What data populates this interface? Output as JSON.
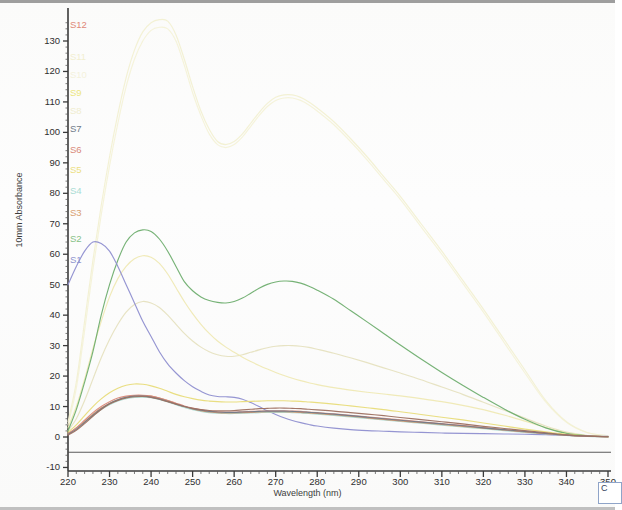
{
  "chart_data": {
    "type": "line",
    "title": "",
    "xlabel": "Wavelength (nm)",
    "ylabel": "10mm Absorbance",
    "xlim": [
      220,
      350
    ],
    "ylim": [
      -10,
      137
    ],
    "xticks": [
      220,
      230,
      240,
      250,
      260,
      270,
      280,
      290,
      300,
      310,
      320,
      330,
      340,
      350
    ],
    "yticks": [
      -10,
      0,
      10,
      20,
      30,
      40,
      50,
      60,
      70,
      80,
      90,
      100,
      110,
      120,
      130
    ],
    "grid": false,
    "legend_position": "left-axis-stack",
    "x": [
      220,
      222,
      224,
      226,
      228,
      230,
      232,
      234,
      236,
      238,
      240,
      242,
      244,
      246,
      248,
      250,
      252,
      254,
      256,
      258,
      260,
      262,
      264,
      266,
      268,
      270,
      272,
      274,
      276,
      278,
      280,
      284,
      288,
      292,
      296,
      300,
      305,
      310,
      315,
      320,
      325,
      330,
      335,
      340,
      345,
      350
    ],
    "series": [
      {
        "name": "S1",
        "color": "#8f8fd0",
        "values": [
          50,
          56,
          61,
          64,
          63.5,
          61,
          56,
          50,
          44,
          38,
          33,
          28,
          24,
          21,
          18.5,
          16.5,
          15,
          13.8,
          13.3,
          13.2,
          13.0,
          12.4,
          11.3,
          10.0,
          8.6,
          7.4,
          6.3,
          5.4,
          4.7,
          4.1,
          3.6,
          2.9,
          2.4,
          2.1,
          1.9,
          1.7,
          1.5,
          1.3,
          1.2,
          1.1,
          1.0,
          0.9,
          0.8,
          0.5,
          0.3,
          0.2
        ]
      },
      {
        "name": "S2",
        "color": "#6fae6f",
        "values": [
          2,
          9,
          18,
          28,
          40,
          50,
          58,
          64,
          67,
          68,
          67.5,
          65,
          61,
          56,
          51,
          48,
          46,
          44.8,
          44.2,
          44.0,
          44.5,
          45.6,
          47.2,
          48.8,
          50.1,
          50.9,
          51.2,
          51.1,
          50.5,
          49.5,
          48.2,
          45.2,
          41.5,
          37.8,
          34.0,
          30.2,
          25.6,
          21.2,
          17.0,
          13.0,
          9.2,
          5.8,
          3.0,
          1.2,
          0.4,
          0.1
        ]
      },
      {
        "name": "S3",
        "color": "#d2956a",
        "values": [
          1,
          3,
          5,
          7.5,
          9.5,
          11,
          12.2,
          13.0,
          13.5,
          13.6,
          13.4,
          12.8,
          12.0,
          11.0,
          10.0,
          9.2,
          8.6,
          8.2,
          8.0,
          7.9,
          7.9,
          8.0,
          8.1,
          8.2,
          8.3,
          8.3,
          8.3,
          8.2,
          8.1,
          7.9,
          7.7,
          7.3,
          6.8,
          6.3,
          5.8,
          5.3,
          4.7,
          4.1,
          3.5,
          2.9,
          2.3,
          1.7,
          1.1,
          0.6,
          0.3,
          0.1
        ]
      },
      {
        "name": "S4",
        "color": "#a8d8d0",
        "values": [
          1,
          2.8,
          4.8,
          7,
          9,
          10.6,
          11.8,
          12.6,
          13.0,
          13.1,
          12.9,
          12.3,
          11.5,
          10.6,
          9.7,
          9.0,
          8.4,
          8.0,
          7.8,
          7.7,
          7.7,
          7.8,
          7.9,
          8.0,
          8.1,
          8.1,
          8.1,
          8.0,
          7.9,
          7.7,
          7.5,
          7.1,
          6.6,
          6.1,
          5.6,
          5.1,
          4.5,
          3.9,
          3.3,
          2.7,
          2.1,
          1.5,
          1.0,
          0.5,
          0.2,
          0.1
        ]
      },
      {
        "name": "S5",
        "color": "#e8dc7a",
        "values": [
          1.5,
          4,
          7,
          10,
          12.5,
          14.5,
          16,
          17,
          17.4,
          17.3,
          16.8,
          16.0,
          15.0,
          14.0,
          13.2,
          12.6,
          12.1,
          11.8,
          11.6,
          11.5,
          11.5,
          11.6,
          11.7,
          11.8,
          11.9,
          11.9,
          11.9,
          11.8,
          11.7,
          11.5,
          11.3,
          10.8,
          10.2,
          9.6,
          9.0,
          8.3,
          7.4,
          6.5,
          5.6,
          4.6,
          3.6,
          2.6,
          1.7,
          0.9,
          0.4,
          0.1
        ]
      },
      {
        "name": "S6",
        "color": "#d98a7a",
        "values": [
          1,
          3,
          5.5,
          8,
          10,
          11.6,
          12.8,
          13.4,
          13.7,
          13.7,
          13.4,
          12.8,
          12.0,
          11.1,
          10.2,
          9.5,
          8.9,
          8.5,
          8.3,
          8.2,
          8.2,
          8.3,
          8.4,
          8.5,
          8.6,
          8.6,
          8.6,
          8.5,
          8.4,
          8.2,
          8.0,
          7.6,
          7.1,
          6.6,
          6.1,
          5.6,
          5.0,
          4.4,
          3.8,
          3.1,
          2.4,
          1.8,
          1.2,
          0.6,
          0.3,
          0.1
        ]
      },
      {
        "name": "S7",
        "color": "#6f7a88",
        "values": [
          0.8,
          2.5,
          4.8,
          7.2,
          9.3,
          11.0,
          12.2,
          13.0,
          13.4,
          13.4,
          13.1,
          12.5,
          11.7,
          10.8,
          10.0,
          9.3,
          8.8,
          8.4,
          8.2,
          8.1,
          8.1,
          8.2,
          8.3,
          8.4,
          8.5,
          8.5,
          8.5,
          8.4,
          8.3,
          8.1,
          7.9,
          7.5,
          7.0,
          6.5,
          6.0,
          5.5,
          4.9,
          4.3,
          3.7,
          3.0,
          2.4,
          1.8,
          1.2,
          0.6,
          0.3,
          0.1
        ]
      },
      {
        "name": "S8",
        "color": "#efe9b4",
        "values": [
          3,
          10,
          19,
          29,
          38,
          46,
          52,
          56,
          58.5,
          59.5,
          59,
          57,
          53.5,
          49,
          44.5,
          40.5,
          37,
          34,
          31.5,
          29.5,
          27.8,
          26.2,
          24.8,
          23.5,
          22.3,
          21.2,
          20.2,
          19.3,
          18.5,
          17.8,
          17.2,
          16.2,
          15.4,
          14.7,
          14.1,
          13.5,
          12.6,
          11.6,
          10.4,
          9.0,
          7.2,
          5.2,
          3.1,
          1.4,
          0.5,
          0.1
        ]
      },
      {
        "name": "S9",
        "color": "#f2f0d2",
        "values": [
          5,
          18,
          38,
          58,
          76,
          92,
          106,
          118,
          127,
          133,
          136,
          137,
          136.5,
          132,
          124,
          115,
          107,
          101,
          97,
          96,
          97,
          99.5,
          103,
          106.5,
          109.5,
          111.5,
          112.3,
          112.3,
          111.5,
          110,
          108,
          103.5,
          98,
          92,
          85.5,
          79,
          70,
          61,
          51.5,
          42,
          32,
          22,
          12,
          5,
          1.5,
          0.4
        ]
      },
      {
        "name": "S10",
        "color": "#f4f2d8",
        "values": [
          4,
          16,
          35,
          55,
          73,
          89,
          103,
          115,
          124,
          130,
          133.5,
          134.5,
          134,
          130,
          122,
          113,
          105.5,
          99.5,
          96,
          95,
          96,
          98.5,
          102,
          105.5,
          108.5,
          110.5,
          111.3,
          111.3,
          110.5,
          109,
          107,
          102.5,
          97,
          91,
          84.5,
          78,
          69,
          60,
          50.5,
          41,
          31,
          21,
          11.5,
          4.8,
          1.4,
          0.4
        ]
      },
      {
        "name": "S11",
        "color": "#e6e2c0",
        "values": [
          2,
          6,
          12,
          19,
          26,
          32,
          37,
          41,
          43.5,
          44.5,
          44,
          42.5,
          40,
          37,
          34,
          31.5,
          29.5,
          28,
          27,
          26.5,
          26.5,
          27,
          27.8,
          28.6,
          29.3,
          29.8,
          30.0,
          30.0,
          29.8,
          29.4,
          28.8,
          27.5,
          26.0,
          24.4,
          22.7,
          21.0,
          18.8,
          16.4,
          14.0,
          11.4,
          8.8,
          6.2,
          3.6,
          1.6,
          0.5,
          0.1
        ]
      },
      {
        "name": "S12",
        "color": "#9e7060",
        "values": [
          0.6,
          2.2,
          4.4,
          6.8,
          9.0,
          10.8,
          12.0,
          12.8,
          13.2,
          13.3,
          13.0,
          12.4,
          11.6,
          10.8,
          10.0,
          9.4,
          9.0,
          8.7,
          8.6,
          8.6,
          8.7,
          8.9,
          9.1,
          9.3,
          9.4,
          9.5,
          9.5,
          9.4,
          9.3,
          9.1,
          8.9,
          8.5,
          8.0,
          7.5,
          7.0,
          6.4,
          5.7,
          5.0,
          4.3,
          3.5,
          2.8,
          2.1,
          1.4,
          0.7,
          0.3,
          0.1
        ]
      }
    ],
    "baseline_value": -5,
    "annotations": []
  },
  "legend": {
    "items": [
      {
        "label": "S12",
        "color": "#e08878"
      },
      {
        "label": "S11",
        "color": "#f2efd0"
      },
      {
        "label": "S10",
        "color": "#f4f2dc"
      },
      {
        "label": "S9",
        "color": "#ece67e"
      },
      {
        "label": "S8",
        "color": "#f0edcf"
      },
      {
        "label": "S7",
        "color": "#6f7a88"
      },
      {
        "label": "S6",
        "color": "#d9897a"
      },
      {
        "label": "S5",
        "color": "#ecdf82"
      },
      {
        "label": "S4",
        "color": "#a9dcd4"
      },
      {
        "label": "S3",
        "color": "#d9a070"
      },
      {
        "label": "S2",
        "color": "#86c186"
      },
      {
        "label": "S1",
        "color": "#8f93cf"
      }
    ]
  },
  "axis": {
    "x_title": "Wavelength (nm)",
    "y_title": "10mm Absorbance"
  },
  "corner": {
    "label": "C"
  }
}
